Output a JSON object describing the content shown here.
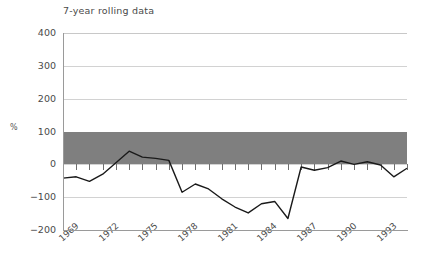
{
  "chart_data": {
    "type": "line",
    "title": "7-year rolling data",
    "xlabel": "",
    "ylabel": "%",
    "ylim": [
      -200,
      400
    ],
    "yticks": [
      -200,
      -100,
      0,
      100,
      200,
      300,
      400
    ],
    "ytick_labels": [
      "−200",
      "−100",
      "0",
      "100",
      "200",
      "300",
      "400"
    ],
    "xlim": [
      1969,
      1995
    ],
    "xticks": [
      1969,
      1972,
      1975,
      1978,
      1981,
      1984,
      1987,
      1990,
      1993
    ],
    "xtick_labels": [
      "1969",
      "1972",
      "1975",
      "1978",
      "1981",
      "1984",
      "1987",
      "1990",
      "1993"
    ],
    "grid": true,
    "legend": "none",
    "shaded_band": {
      "from": 0,
      "to": 100,
      "color": "#7f7f7f",
      "label": ""
    },
    "line_color": "#1a1a1a",
    "x": [
      1969,
      1970,
      1971,
      1972,
      1973,
      1974,
      1975,
      1976,
      1977,
      1978,
      1979,
      1980,
      1981,
      1982,
      1983,
      1984,
      1985,
      1986,
      1987,
      1988,
      1989,
      1990,
      1991,
      1992,
      1993,
      1994,
      1995
    ],
    "values": [
      -42,
      -38,
      -52,
      -30,
      5,
      40,
      22,
      18,
      12,
      -85,
      -60,
      -75,
      -105,
      -130,
      -148,
      -120,
      -113,
      -165,
      -8,
      -18,
      -10,
      10,
      0,
      8,
      -2,
      -38,
      -12
    ],
    "series": [
      {
        "name": "7-year rolling data",
        "values": [
          -42,
          -38,
          -52,
          -30,
          5,
          40,
          22,
          18,
          12,
          -85,
          -60,
          -75,
          -105,
          -130,
          -148,
          -120,
          -113,
          -165,
          -8,
          -18,
          -10,
          10,
          0,
          8,
          -2,
          -38,
          -12
        ]
      }
    ]
  }
}
